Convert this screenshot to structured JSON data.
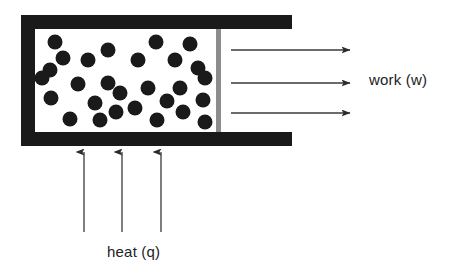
{
  "diagram": {
    "canvas": {
      "width": 457,
      "height": 276,
      "background": "#ffffff"
    },
    "labels": {
      "work": "work (w)",
      "heat": "heat (q)"
    },
    "colors": {
      "frame": "#1a1a1a",
      "chamber": "#ffffff",
      "particle": "#1a1a1a",
      "piston": "#8c8c8c",
      "arrow": "#3a3a3a",
      "text": "#222222"
    },
    "cylinder": {
      "outer": {
        "x": 21,
        "y": 15,
        "width": 271,
        "height": 131
      },
      "wall_thickness": 14,
      "chamber": {
        "x": 35,
        "y": 29,
        "width": 181,
        "height": 103
      },
      "open_side": "right"
    },
    "piston": {
      "x": 216,
      "y": 29,
      "width": 5,
      "height": 103,
      "fill": "#8c8c8c"
    },
    "particles": {
      "count": 28,
      "radius": 7.5,
      "positions": [
        [
          55,
          42
        ],
        [
          108,
          50
        ],
        [
          88,
          60
        ],
        [
          50,
          70
        ],
        [
          156,
          42
        ],
        [
          190,
          44
        ],
        [
          138,
          60
        ],
        [
          175,
          60
        ],
        [
          198,
          68
        ],
        [
          42,
          78
        ],
        [
          78,
          84
        ],
        [
          108,
          83
        ],
        [
          51,
          98
        ],
        [
          116,
          112
        ],
        [
          70,
          119
        ],
        [
          148,
          88
        ],
        [
          180,
          88
        ],
        [
          205,
          78
        ],
        [
          203,
          100
        ],
        [
          135,
          108
        ],
        [
          157,
          120
        ],
        [
          183,
          112
        ],
        [
          205,
          122
        ],
        [
          100,
          120
        ],
        [
          120,
          93
        ],
        [
          63,
          58
        ],
        [
          167,
          101
        ],
        [
          95,
          103
        ]
      ]
    },
    "work_arrows": {
      "direction": "right",
      "count": 3,
      "x_start": 231,
      "x_end": 350,
      "ys": [
        50,
        83,
        113
      ]
    },
    "heat_arrows": {
      "direction": "up",
      "count": 3,
      "y_start": 232,
      "y_end": 152,
      "xs": [
        84,
        122,
        161
      ]
    }
  }
}
